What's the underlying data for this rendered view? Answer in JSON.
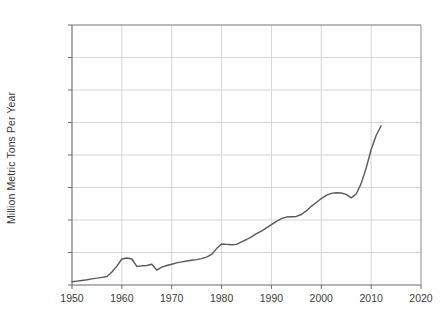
{
  "chart_data": {
    "type": "line",
    "title": "",
    "xlabel": "",
    "ylabel": "Million Metric Tons Per Year",
    "xlim": [
      1950,
      2020
    ],
    "ylim": [
      0,
      4000
    ],
    "xticks": [
      "1950",
      "1960",
      "1970",
      "1980",
      "1990",
      "2000",
      "2010",
      "2020"
    ],
    "xtick_values": [
      1950,
      1960,
      1970,
      1980,
      1990,
      2000,
      2010,
      2020
    ],
    "yticks": [
      "0",
      "500",
      "1,000",
      "1,500",
      "2,000",
      "2,500",
      "3,000",
      "3,500",
      "4,000"
    ],
    "ytick_values": [
      0,
      500,
      1000,
      1500,
      2000,
      2500,
      3000,
      3500,
      4000
    ],
    "grid": true,
    "legend": "none",
    "line_color": "#595959",
    "grid_color": "#d0d0d0",
    "axis_color": "#6b6b6b",
    "text_color": "#3b3b3b",
    "background": "#ffffff",
    "series": [
      {
        "name": "Emissions",
        "x": [
          1950,
          1951,
          1952,
          1953,
          1954,
          1955,
          1956,
          1957,
          1958,
          1959,
          1960,
          1961,
          1962,
          1963,
          1964,
          1965,
          1966,
          1967,
          1968,
          1969,
          1970,
          1971,
          1972,
          1973,
          1974,
          1975,
          1976,
          1977,
          1978,
          1979,
          1980,
          1981,
          1982,
          1983,
          1984,
          1985,
          1986,
          1987,
          1988,
          1989,
          1990,
          1991,
          1992,
          1993,
          1994,
          1995,
          1996,
          1997,
          1998,
          1999,
          2000,
          2001,
          2002,
          2003,
          2004,
          2005,
          2006,
          2007,
          2008,
          2009,
          2010,
          2011,
          2012
        ],
        "values": [
          50,
          60,
          70,
          80,
          95,
          105,
          118,
          130,
          200,
          290,
          400,
          415,
          400,
          285,
          295,
          300,
          320,
          230,
          275,
          300,
          320,
          340,
          355,
          370,
          380,
          390,
          405,
          430,
          470,
          560,
          630,
          625,
          620,
          625,
          665,
          700,
          740,
          790,
          830,
          880,
          930,
          980,
          1020,
          1045,
          1050,
          1055,
          1085,
          1140,
          1210,
          1270,
          1330,
          1380,
          1410,
          1420,
          1415,
          1395,
          1340,
          1400,
          1560,
          1800,
          2080,
          2300,
          2450
        ]
      }
    ],
    "series_smoothed_note": "single continuous line, no markers"
  },
  "axes": {
    "y_axis_title": "Million Metric Tons Per Year"
  }
}
